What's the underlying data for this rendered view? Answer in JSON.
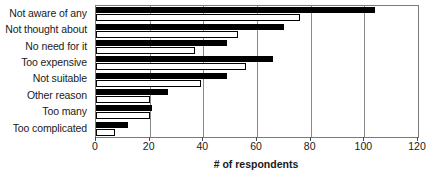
{
  "chart_data": {
    "type": "bar",
    "orientation": "horizontal",
    "title": "",
    "xlabel": "# of respondents",
    "ylabel": "",
    "xlim": [
      0,
      120
    ],
    "xticks": [
      0,
      20,
      40,
      60,
      80,
      100,
      120
    ],
    "grid": true,
    "legend": false,
    "legend_position": "none",
    "categories": [
      "Not aware of any",
      "Not thought about",
      "No need for it",
      "Too expensive",
      "Not suitable",
      "Other reason",
      "Too many",
      "Too complicated"
    ],
    "series": [
      {
        "name": "Series 1",
        "style": "filled-black",
        "color": "#000000",
        "values": [
          104,
          70,
          49,
          66,
          49,
          27,
          21,
          12
        ]
      },
      {
        "name": "Series 2",
        "style": "open-white",
        "color": "#ffffff",
        "values": [
          76,
          53,
          37,
          56,
          39,
          20,
          20,
          7
        ]
      }
    ]
  },
  "axis": {
    "tick_labels": [
      "0",
      "20",
      "40",
      "60",
      "80",
      "100",
      "120"
    ]
  },
  "colors": {
    "series_a": "#000000",
    "series_b": "#ffffff",
    "outline": "#000000",
    "gridline": "#8a8a8a",
    "frame": "#7a7a7a",
    "text": "#1a1a1a",
    "background": "#ffffff"
  }
}
